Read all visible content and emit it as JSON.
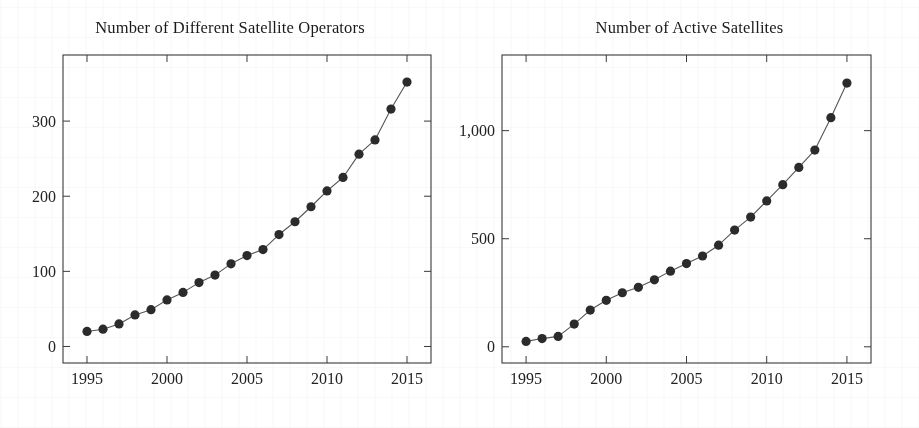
{
  "figure": {
    "panels": [
      {
        "id": "operators",
        "title": "Number of Different Satellite Operators"
      },
      {
        "id": "satellites",
        "title": "Number of Active Satellites"
      }
    ]
  },
  "chart_data": [
    {
      "type": "line",
      "id": "operators",
      "title": "Number of Different Satellite Operators",
      "xlabel": "",
      "ylabel": "",
      "x": [
        1995,
        1996,
        1997,
        1998,
        1999,
        2000,
        2001,
        2002,
        2003,
        2004,
        2005,
        2006,
        2007,
        2008,
        2009,
        2010,
        2011,
        2012,
        2013,
        2014,
        2015
      ],
      "values": [
        20,
        23,
        30,
        42,
        49,
        62,
        72,
        85,
        95,
        110,
        121,
        129,
        149,
        166,
        186,
        207,
        225,
        256,
        275,
        316,
        352
      ],
      "xtick_labels": [
        "1995",
        "2000",
        "2005",
        "2010",
        "2015"
      ],
      "xticks": [
        1995,
        2000,
        2005,
        2010,
        2015
      ],
      "ytick_labels": [
        "0",
        "100",
        "200",
        "300"
      ],
      "yticks": [
        0,
        100,
        200,
        300
      ],
      "xlim": [
        1993.5,
        2016.5
      ],
      "ylim": [
        -22,
        388
      ],
      "grid": false,
      "legend": false,
      "marker": "filled-circle",
      "marker_color": "#2b2b2b",
      "line_color": "#555555"
    },
    {
      "type": "line",
      "id": "satellites",
      "title": "Number of Active Satellites",
      "xlabel": "",
      "ylabel": "",
      "x": [
        1995,
        1996,
        1997,
        1998,
        1999,
        2000,
        2001,
        2002,
        2003,
        2004,
        2005,
        2006,
        2007,
        2008,
        2009,
        2010,
        2011,
        2012,
        2013,
        2014,
        2015
      ],
      "values": [
        25,
        38,
        48,
        105,
        170,
        215,
        250,
        275,
        310,
        350,
        385,
        420,
        470,
        540,
        600,
        675,
        750,
        830,
        910,
        1060,
        1220
      ],
      "xtick_labels": [
        "1995",
        "2000",
        "2005",
        "2010",
        "2015"
      ],
      "xticks": [
        1995,
        2000,
        2005,
        2010,
        2015
      ],
      "ytick_labels": [
        "0",
        "500",
        "1,000"
      ],
      "yticks": [
        0,
        500,
        1000
      ],
      "xlim": [
        1993.5,
        2016.5
      ],
      "ylim": [
        -75,
        1350
      ],
      "grid": false,
      "legend": false,
      "marker": "filled-circle",
      "marker_color": "#2b2b2b",
      "line_color": "#555555"
    }
  ]
}
